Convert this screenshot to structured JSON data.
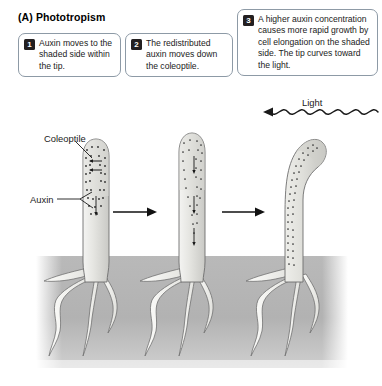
{
  "panel": {
    "label": "(A)",
    "title": "(A)  Phototropism",
    "title_text": "Phototropism"
  },
  "steps": [
    {
      "number": "1",
      "text": "Auxin moves to the shaded side within the tip."
    },
    {
      "number": "2",
      "text": "The redistributed auxin moves down the coleoptile."
    },
    {
      "number": "3",
      "text": "A higher auxin concentration causes more rapid growth by cell elongation on the shaded side. The tip curves toward the light."
    }
  ],
  "labels": {
    "coleoptile": "Coleoptile",
    "auxin": "Auxin",
    "light": "Light"
  },
  "icons": {
    "light_wave": "wavy-light-ray-icon",
    "flow_arrow": "right-arrow-icon",
    "auxin_transport_arrow": "auxin-arrow-icon"
  },
  "colors": {
    "callout_border": "#8d9aa6",
    "badge_background": "#231f20",
    "badge_text": "#ffffff",
    "soil": "#b4b4b4",
    "plant_outline": "#6e6e6e",
    "auxin_dot": "#333333",
    "text": "#1a1a1a",
    "background": "#ffffff"
  },
  "scene": {
    "stage_count": 3,
    "stages": [
      {
        "name": "upright-coleoptile-auxin-redistributing"
      },
      {
        "name": "upright-coleoptile-auxin-descending"
      },
      {
        "name": "curved-coleoptile-bending-toward-light"
      }
    ],
    "soil_label": "soil-block",
    "roots_per_plant": 4
  }
}
